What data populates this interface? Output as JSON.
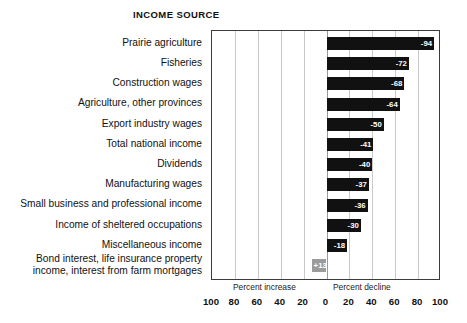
{
  "chart_data": {
    "type": "bar",
    "title": "INCOME SOURCE",
    "orientation": "horizontal",
    "xlabel": "",
    "ylabel": "INCOME SOURCE",
    "xlim": [
      -100,
      100
    ],
    "grid": true,
    "legend": false,
    "axis_captions": {
      "left": "Percent increase",
      "right": "Percent decline"
    },
    "tick_labels": [
      "100",
      "80",
      "60",
      "40",
      "20",
      "0",
      "20",
      "40",
      "60",
      "80",
      "100"
    ],
    "tick_values": [
      -100,
      -80,
      -60,
      -40,
      -20,
      0,
      20,
      40,
      60,
      80,
      100
    ],
    "note": "Axis is mirrored: values to the right of 0 are percent decline, values to the left are percent increase.",
    "categories": [
      "Prairie agriculture",
      "Fisheries",
      "Construction wages",
      "Agriculture, other provinces",
      "Export industry wages",
      "Total national income",
      "Dividends",
      "Manufacturing wages",
      "Small business and professional income",
      "Income of sheltered occupations",
      "Miscellaneous income",
      "Bond interest, life insurance property\nincome, interest from farm mortgages"
    ],
    "values": [
      -94,
      -72,
      -68,
      -64,
      -50,
      -41,
      -40,
      -37,
      -36,
      -30,
      -18,
      13
    ],
    "value_labels": [
      "-94",
      "-72",
      "-68",
      "-64",
      "-50",
      "-41",
      "-40",
      "-37",
      "-36",
      "-30",
      "-18",
      "+13"
    ],
    "bar_colors": [
      "#111111",
      "#111111",
      "#111111",
      "#111111",
      "#111111",
      "#111111",
      "#111111",
      "#111111",
      "#111111",
      "#111111",
      "#111111",
      "#9b9b9b"
    ],
    "colors": {
      "decline_bar": "#111111",
      "increase_bar": "#9b9b9b",
      "value_text": "#ffffff",
      "gridline": "#c9c9c9",
      "plot_border": "#3b3b3b",
      "background": "#ffffff",
      "text": "#111111"
    }
  }
}
